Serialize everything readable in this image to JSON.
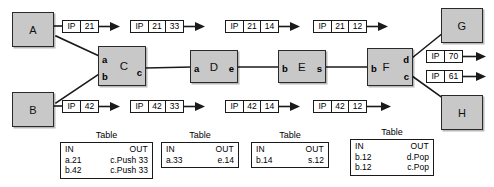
{
  "diagram": {
    "colors": {
      "node_fill": "#c8c8c8",
      "node_stroke": "#2a2a2a",
      "packet_fill": "#ffffff",
      "line": "#1a1a1a"
    },
    "nodes": [
      {
        "id": "A",
        "label": "A",
        "kind": "host",
        "x": 12,
        "y": 12,
        "w": 42,
        "h": 35,
        "ports": []
      },
      {
        "id": "B",
        "label": "B",
        "kind": "host",
        "x": 12,
        "y": 92,
        "w": 42,
        "h": 35,
        "ports": []
      },
      {
        "id": "C",
        "label": "C",
        "kind": "router",
        "x": 98,
        "y": 46,
        "w": 48,
        "h": 40,
        "ports": [
          {
            "name": "a",
            "side": "left",
            "offset": 9
          },
          {
            "name": "b",
            "side": "left",
            "offset": 26
          },
          {
            "name": "c",
            "side": "right",
            "offset": 22
          }
        ]
      },
      {
        "id": "D",
        "label": "D",
        "kind": "router",
        "x": 190,
        "y": 50,
        "w": 48,
        "h": 33,
        "ports": [
          {
            "name": "a",
            "side": "left",
            "offset": 14
          },
          {
            "name": "e",
            "side": "right",
            "offset": 14
          }
        ]
      },
      {
        "id": "E",
        "label": "E",
        "kind": "router",
        "x": 278,
        "y": 50,
        "w": 48,
        "h": 33,
        "ports": [
          {
            "name": "b",
            "side": "left",
            "offset": 14
          },
          {
            "name": "s",
            "side": "right",
            "offset": 14
          }
        ]
      },
      {
        "id": "F",
        "label": "F",
        "kind": "router",
        "x": 367,
        "y": 48,
        "w": 46,
        "h": 38,
        "ports": [
          {
            "name": "b",
            "side": "left",
            "offset": 16
          },
          {
            "name": "d",
            "side": "right",
            "offset": 8
          },
          {
            "name": "c",
            "side": "right",
            "offset": 24
          }
        ]
      },
      {
        "id": "G",
        "label": "G",
        "kind": "host",
        "x": 441,
        "y": 8,
        "w": 42,
        "h": 35,
        "ports": []
      },
      {
        "id": "H",
        "label": "H",
        "kind": "host",
        "x": 441,
        "y": 95,
        "w": 42,
        "h": 35,
        "ports": []
      }
    ],
    "packets": [
      {
        "id": "p1",
        "x": 62,
        "y": 20,
        "fields": [
          "IP",
          "21"
        ],
        "arrow": true
      },
      {
        "id": "p2",
        "x": 130,
        "y": 20,
        "fields": [
          "IP",
          "21",
          "33"
        ],
        "arrow": true
      },
      {
        "id": "p3",
        "x": 225,
        "y": 20,
        "fields": [
          "IP",
          "21",
          "14"
        ],
        "arrow": true
      },
      {
        "id": "p4",
        "x": 313,
        "y": 20,
        "fields": [
          "IP",
          "21",
          "12"
        ],
        "arrow": true
      },
      {
        "id": "p5",
        "x": 62,
        "y": 100,
        "fields": [
          "IP",
          "42"
        ],
        "arrow": true
      },
      {
        "id": "p6",
        "x": 130,
        "y": 100,
        "fields": [
          "IP",
          "42",
          "33"
        ],
        "arrow": true
      },
      {
        "id": "p7",
        "x": 225,
        "y": 100,
        "fields": [
          "IP",
          "42",
          "14"
        ],
        "arrow": true
      },
      {
        "id": "p8",
        "x": 313,
        "y": 100,
        "fields": [
          "IP",
          "42",
          "12"
        ],
        "arrow": true
      },
      {
        "id": "p9",
        "x": 426,
        "y": 50,
        "fields": [
          "IP",
          "70"
        ],
        "arrow": true
      },
      {
        "id": "p10",
        "x": 426,
        "y": 70,
        "fields": [
          "IP",
          "61"
        ],
        "arrow": true
      }
    ],
    "tables": [
      {
        "id": "table-c",
        "title": "Table",
        "x": 60,
        "y": 133,
        "w": 93,
        "headers": {
          "in": "IN",
          "out": "OUT"
        },
        "rows": [
          {
            "in": "a.21",
            "out": "c.Push 33"
          },
          {
            "in": "b.42",
            "out": "c.Push 33"
          }
        ]
      },
      {
        "id": "table-d",
        "title": "Table",
        "x": 161,
        "y": 133,
        "w": 78,
        "headers": {
          "in": "IN",
          "out": "OUT"
        },
        "rows": [
          {
            "in": "a.33",
            "out": "e.14"
          }
        ]
      },
      {
        "id": "table-e",
        "title": "Table",
        "x": 251,
        "y": 133,
        "w": 78,
        "headers": {
          "in": "IN",
          "out": "OUT"
        },
        "rows": [
          {
            "in": "b.14",
            "out": "s.12"
          }
        ]
      },
      {
        "id": "table-f",
        "title": "Table",
        "x": 350,
        "y": 130,
        "w": 84,
        "headers": {
          "in": "IN",
          "out": "OUT"
        },
        "rows": [
          {
            "in": "b.12",
            "out": "d.Pop"
          },
          {
            "in": "b.12",
            "out": "c.Pop"
          }
        ]
      }
    ],
    "links": [
      {
        "id": "link-a-c",
        "from": "A",
        "to": "C",
        "points": "54,37 98,55"
      },
      {
        "id": "link-b-c",
        "from": "B",
        "to": "C",
        "points": "54,104 98,72"
      },
      {
        "id": "link-c-d",
        "from": "C",
        "to": "D",
        "points": "146,68 190,67"
      },
      {
        "id": "link-d-e",
        "from": "D",
        "to": "E",
        "points": "238,66 278,66"
      },
      {
        "id": "link-e-f",
        "from": "E",
        "to": "F",
        "points": "326,66 367,66"
      },
      {
        "id": "link-f-g",
        "from": "F",
        "to": "G",
        "points": "413,57 441,33"
      },
      {
        "id": "link-f-h",
        "from": "F",
        "to": "H",
        "points": "413,74 441,100"
      },
      {
        "id": "link-a-p1",
        "from": "A",
        "to": "p1",
        "points": "54,26 62,26"
      },
      {
        "id": "link-b-p5",
        "from": "B",
        "to": "p5",
        "points": "54,106 62,106"
      }
    ]
  }
}
